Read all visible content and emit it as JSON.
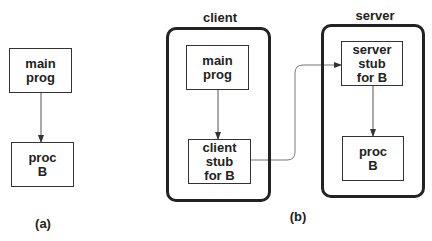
{
  "diagram_a": {
    "caption": "(a)",
    "boxes": [
      {
        "id": "main-prog",
        "label": "main\nprog"
      },
      {
        "id": "proc-b",
        "label": "proc\nB"
      }
    ]
  },
  "diagram_b": {
    "caption": "(b)",
    "client": {
      "title": "client",
      "boxes": [
        {
          "id": "main-prog",
          "label": "main\nprog"
        },
        {
          "id": "client-stub",
          "label": "client\nstub\nfor B"
        }
      ]
    },
    "server": {
      "title": "server",
      "boxes": [
        {
          "id": "server-stub",
          "label": "server\nstub\nfor B"
        },
        {
          "id": "proc-b",
          "label": "proc\nB"
        }
      ]
    }
  },
  "edges": [
    {
      "from": "a.main-prog",
      "to": "a.proc-b"
    },
    {
      "from": "client.main-prog",
      "to": "client.client-stub"
    },
    {
      "from": "client.client-stub",
      "to": "server.server-stub"
    },
    {
      "from": "server.server-stub",
      "to": "server.proc-b"
    }
  ]
}
